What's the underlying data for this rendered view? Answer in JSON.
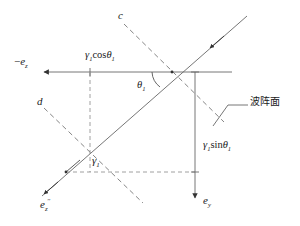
{
  "figure": {
    "type": "physics-ray-diagram",
    "background": "#ffffff",
    "line_color": "#555555",
    "text_color": "#1a1a1a"
  },
  "labels": {
    "axis_left": {
      "base": "e",
      "sub": "z",
      "prefix": "−"
    },
    "ray_label_c": "c",
    "ray_label_d": "d",
    "cos_term": {
      "gamma": "γ",
      "gsub": "1",
      "fn": "cos",
      "theta": "θ",
      "tsub": "1"
    },
    "sin_term": {
      "gamma": "γ",
      "gsub": "1",
      "fn": "sin",
      "theta": "θ",
      "tsub": "1"
    },
    "gamma_one": {
      "base": "γ",
      "sub": "1"
    },
    "angle_theta": {
      "base": "θ",
      "sub": "1"
    },
    "e_z_double_prime": {
      "base": "e",
      "sub": "z",
      "prime": "′′"
    },
    "e_y": {
      "base": "e",
      "sub": "y"
    },
    "wavefront_cjk": "波阵面"
  },
  "geometry": {
    "origin": {
      "x": 172,
      "y": 72
    },
    "foot": {
      "x": 65,
      "y": 172
    },
    "vertical_drop_x": 195,
    "vertical_drop_bottom": 200,
    "dashed_vertical_x": 90,
    "horizontal_axis_y": 72,
    "axis_arrow_x": 38
  }
}
